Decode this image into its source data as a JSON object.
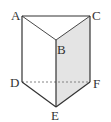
{
  "diagram": {
    "type": "triangular-prism",
    "vertices": {
      "A": {
        "label": "A",
        "x": 22,
        "y": 16
      },
      "B": {
        "label": "B",
        "x": 56,
        "y": 40
      },
      "C": {
        "label": "C",
        "x": 90,
        "y": 16
      },
      "D": {
        "label": "D",
        "x": 22,
        "y": 82
      },
      "E": {
        "label": "E",
        "x": 56,
        "y": 107
      },
      "F": {
        "label": "F",
        "x": 90,
        "y": 82
      }
    },
    "shaded_face": [
      "B",
      "C",
      "F",
      "E"
    ],
    "hidden_edge": [
      "D",
      "F"
    ],
    "colors": {
      "line": "#333333",
      "shade": "#e4e4e4",
      "hidden": "#777777"
    }
  }
}
